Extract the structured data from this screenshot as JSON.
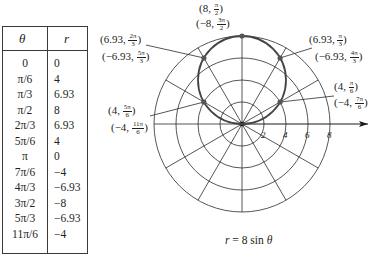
{
  "table": {
    "headers": {
      "theta": "θ",
      "r": "r"
    },
    "rows": [
      {
        "theta": "0",
        "r": "0"
      },
      {
        "theta": "π/6",
        "r": "4"
      },
      {
        "theta": "π/3",
        "r": "6.93"
      },
      {
        "theta": "π/2",
        "r": "8"
      },
      {
        "theta": "2π/3",
        "r": "6.93"
      },
      {
        "theta": "5π/6",
        "r": "4"
      },
      {
        "theta": "π",
        "r": "0"
      },
      {
        "theta": "7π/6",
        "r": "−4"
      },
      {
        "theta": "4π/3",
        "r": "−6.93"
      },
      {
        "theta": "3π/2",
        "r": "−8"
      },
      {
        "theta": "5π/3",
        "r": "−6.93"
      },
      {
        "theta": "11π/6",
        "r": "−4"
      }
    ]
  },
  "graph": {
    "axis_ticks": [
      "2",
      "4",
      "6",
      "8"
    ],
    "caption": {
      "lhs": "r",
      "eq": " = 8 sin ",
      "var": "θ"
    },
    "labels": {
      "top_a": {
        "pre": "(8, ",
        "num": "π",
        "den": "2",
        "post": ")"
      },
      "top_b": {
        "pre": "(−8, ",
        "num": "3π",
        "den": "2",
        "post": ")"
      },
      "ul_a": {
        "pre": "(6.93, ",
        "num": "2π",
        "den": "3",
        "post": ")"
      },
      "ul_b": {
        "pre": "(−6.93, ",
        "num": "5π",
        "den": "3",
        "post": ")"
      },
      "ur_a": {
        "pre": "(6.93, ",
        "num": "π",
        "den": "3",
        "post": ")"
      },
      "ur_b": {
        "pre": "(−6.93, ",
        "num": "4π",
        "den": "3",
        "post": ")"
      },
      "rl_a": {
        "pre": "(4, ",
        "num": "π",
        "den": "6",
        "post": ")"
      },
      "rl_b": {
        "pre": "(−4, ",
        "num": "7π",
        "den": "6",
        "post": ")"
      },
      "ll_a": {
        "pre": "(4, ",
        "num": "5π",
        "den": "6",
        "post": ")"
      },
      "ll_b": {
        "pre": "(−4, ",
        "num": "11π",
        "den": "6",
        "post": ")"
      }
    }
  },
  "chart_data": {
    "type": "scatter",
    "title": "r = 8 sin θ",
    "coordinate_system": "polar",
    "x": [
      "0",
      "π/6",
      "π/3",
      "π/2",
      "2π/3",
      "5π/6",
      "π",
      "7π/6",
      "4π/3",
      "3π/2",
      "5π/3",
      "11π/6"
    ],
    "series": [
      {
        "name": "r",
        "values": [
          0,
          4,
          6.93,
          8,
          6.93,
          4,
          0,
          -4,
          -6.93,
          -8,
          -6.93,
          -4
        ]
      }
    ],
    "plotted_points": [
      {
        "r": 8,
        "theta": "π/2",
        "alt": "(−8, 3π/2)"
      },
      {
        "r": 6.93,
        "theta": "2π/3",
        "alt": "(−6.93, 5π/3)"
      },
      {
        "r": 6.93,
        "theta": "π/3",
        "alt": "(−6.93, 4π/3)"
      },
      {
        "r": 4,
        "theta": "π/6",
        "alt": "(−4, 7π/6)"
      },
      {
        "r": 4,
        "theta": "5π/6",
        "alt": "(−4, 11π/6)"
      },
      {
        "r": 0,
        "theta": "0"
      }
    ],
    "curve": "circle centered (0,4) radius 4",
    "radial_ticks": [
      2,
      4,
      6,
      8
    ],
    "angular_spokes_deg": 30,
    "rlim": [
      0,
      8
    ]
  }
}
